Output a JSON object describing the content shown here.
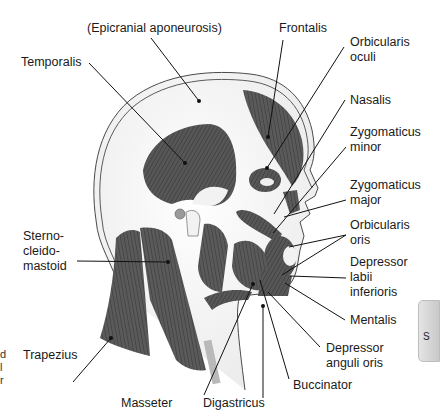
{
  "figure": {
    "colors": {
      "muscle": "#5a5a5a",
      "muscle_dark": "#3f3f3f",
      "outline": "#4a4a4a",
      "skin": "#f4f4f4",
      "leader": "#111111"
    }
  },
  "labels": {
    "epicranial": "(Epicranial aponeurosis)",
    "temporalis": "Temporalis",
    "frontalis": "Frontalis",
    "orbicularis_oculi": "Orbicularis\noculi",
    "nasalis": "Nasalis",
    "zygomaticus_minor": "Zygomaticus\nminor",
    "zygomaticus_major": "Zygomaticus\nmajor",
    "orbicularis_oris": "Orbicularis\noris",
    "depressor_labii": "Depressor\nlabii\ninferioris",
    "mentalis": "Mentalis",
    "depressor_anguli": "Depressor\nanguli oris",
    "buccinator": "Buccinator",
    "digastricus": "Digastricus",
    "masseter": "Masseter",
    "trapezius": "Trapezius",
    "sternocleidomastoid": "Sterno-\ncleido-\nmastoid"
  },
  "edge_fragments": {
    "left": "d\nl\nr",
    "tab": "S"
  }
}
